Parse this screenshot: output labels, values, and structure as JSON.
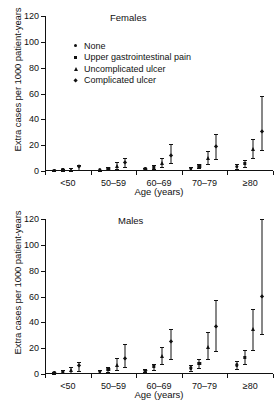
{
  "figure": {
    "xlabel": "Age (years)",
    "ylabel": "Extra cases per 1000 patient-years"
  },
  "legend": {
    "position": "inside-top-left",
    "items": [
      {
        "label": "None",
        "marker": "circle-marker"
      },
      {
        "label": "Upper gastrointestinal pain",
        "marker": "square-marker"
      },
      {
        "label": "Uncomplicated ulcer",
        "marker": "triangle-marker"
      },
      {
        "label": "Complicated ulcer",
        "marker": "diamond-marker"
      }
    ]
  },
  "chart_data": [
    {
      "type": "scatter",
      "title": "Females",
      "xlabel": "Age (years)",
      "ylabel": "Extra cases per 1000 patient-years",
      "ylim": [
        0,
        120
      ],
      "yticks": [
        0,
        20,
        40,
        60,
        80,
        100,
        120
      ],
      "grid": false,
      "errorbars": "95% confidence interval",
      "categories": [
        "<50",
        "50–59",
        "60–69",
        "70–79",
        "≥80"
      ],
      "series": [
        {
          "name": "None",
          "marker": "circle",
          "values": [
            0.2,
            0.4,
            1.2,
            1.8,
            3.2
          ],
          "lower": [
            0.0,
            0.0,
            0.4,
            0.8,
            1.6
          ],
          "upper": [
            0.6,
            1.0,
            2.2,
            3.0,
            5.2
          ]
        },
        {
          "name": "Upper gastrointestinal pain",
          "marker": "square",
          "values": [
            0.6,
            1.6,
            2.8,
            3.6,
            5.8
          ],
          "lower": [
            0.2,
            0.6,
            1.4,
            2.0,
            3.2
          ],
          "upper": [
            1.2,
            2.8,
            4.4,
            5.6,
            8.6
          ]
        },
        {
          "name": "Uncomplicated ulcer",
          "marker": "triangle",
          "values": [
            1.0,
            3.6,
            6.4,
            10.2,
            17.0
          ],
          "lower": [
            0.2,
            1.4,
            3.4,
            5.4,
            9.8
          ],
          "upper": [
            2.2,
            7.0,
            10.4,
            15.6,
            24.8
          ]
        },
        {
          "name": "Complicated ulcer",
          "marker": "diamond",
          "values": [
            2.8,
            6.4,
            11.8,
            18.4,
            30.4
          ],
          "lower": [
            1.0,
            2.8,
            6.2,
            9.6,
            16.0
          ],
          "upper": [
            4.8,
            10.0,
            21.0,
            29.0,
            58.0
          ]
        }
      ]
    },
    {
      "type": "scatter",
      "title": "Males",
      "xlabel": "Age (years)",
      "ylabel": "Extra cases per 1000 patient-years",
      "ylim": [
        0,
        120
      ],
      "yticks": [
        0,
        20,
        40,
        60,
        80,
        100,
        120
      ],
      "grid": false,
      "errorbars": "95% confidence interval",
      "categories": [
        "<50",
        "50–59",
        "60–69",
        "70–79",
        "≥80"
      ],
      "series": [
        {
          "name": "None",
          "marker": "circle",
          "values": [
            0.6,
            1.6,
            2.6,
            4.4,
            6.8
          ],
          "lower": [
            0.2,
            0.6,
            1.2,
            2.4,
            4.0
          ],
          "upper": [
            1.2,
            2.8,
            4.2,
            6.6,
            10.0
          ]
        },
        {
          "name": "Upper gastrointestinal pain",
          "marker": "square",
          "values": [
            1.8,
            3.4,
            5.4,
            7.8,
            12.6
          ],
          "lower": [
            0.6,
            1.8,
            3.4,
            5.0,
            8.0
          ],
          "upper": [
            3.4,
            5.6,
            8.0,
            11.6,
            18.4
          ]
        },
        {
          "name": "Uncomplicated ulcer",
          "marker": "triangle",
          "values": [
            3.0,
            7.0,
            13.6,
            21.0,
            35.0
          ],
          "lower": [
            1.0,
            3.4,
            7.4,
            11.4,
            18.2
          ],
          "upper": [
            5.6,
            12.2,
            21.0,
            32.4,
            50.0
          ]
        },
        {
          "name": "Complicated ulcer",
          "marker": "diamond",
          "values": [
            6.0,
            11.6,
            24.4,
            36.6,
            60.0
          ],
          "lower": [
            2.6,
            5.2,
            11.4,
            17.6,
            31.0
          ],
          "upper": [
            9.4,
            23.0,
            35.0,
            57.2,
            120.0
          ]
        }
      ]
    }
  ]
}
